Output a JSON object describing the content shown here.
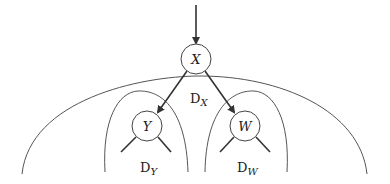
{
  "diagram": {
    "type": "tree-domains",
    "colors": {
      "stroke": "#333333",
      "thin": "#555555",
      "background": "#ffffff"
    },
    "nodes": [
      {
        "id": "X",
        "label": "X",
        "cx": 196,
        "cy": 59,
        "r": 15
      },
      {
        "id": "Y",
        "label": "Y",
        "cx": 147,
        "cy": 126,
        "r": 15
      },
      {
        "id": "W",
        "label": "W",
        "cx": 245,
        "cy": 126,
        "r": 15
      }
    ],
    "edges": [
      {
        "from": "X",
        "to": "Y",
        "directed": true
      },
      {
        "from": "X",
        "to": "W",
        "directed": true
      }
    ],
    "incoming_arrow": {
      "to": "X"
    },
    "domains": [
      {
        "id": "DX",
        "base": "D",
        "sub": "X",
        "region": "outer arc"
      },
      {
        "id": "DY",
        "base": "D",
        "sub": "Y",
        "region": "left inner arc"
      },
      {
        "id": "DW",
        "base": "D",
        "sub": "W",
        "region": "right inner arc"
      }
    ]
  }
}
